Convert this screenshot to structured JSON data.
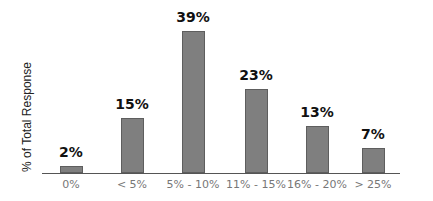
{
  "chart_data": {
    "type": "bar",
    "title": "",
    "xlabel": "",
    "ylabel": "% of Total Response",
    "categories": [
      "0%",
      "< 5%",
      "5% - 10%",
      "11% - 15%",
      "16% - 20%",
      "> 25%"
    ],
    "values": [
      2,
      15,
      39,
      23,
      13,
      7
    ],
    "value_labels": [
      "2%",
      "15%",
      "39%",
      "23%",
      "13%",
      "7%"
    ],
    "grid": false,
    "legend": null,
    "bar_color": "#7f7f7f"
  }
}
